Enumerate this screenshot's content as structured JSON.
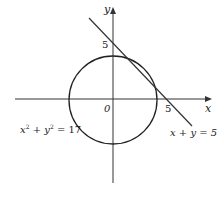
{
  "diagram": {
    "axes": {
      "x_label": "x",
      "y_label": "y",
      "origin_label": "0",
      "x_tick_label": "5",
      "y_tick_label": "5"
    },
    "circle": {
      "equation_lhs_x": "x",
      "equation_sup_x": "2",
      "equation_plus": " + ",
      "equation_lhs_y": "y",
      "equation_sup_y": "2",
      "equation_rhs": " = 17",
      "radius_squared": 17
    },
    "line": {
      "equation": "x + y = 5",
      "x_intercept": 5,
      "y_intercept": 5
    },
    "colors": {
      "stroke": "#222222",
      "background": "#ffffff"
    }
  }
}
